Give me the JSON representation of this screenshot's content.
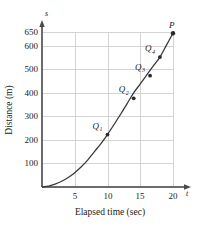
{
  "chart_data": {
    "type": "line",
    "title": "",
    "xlabel": "Elapsed time (sec)",
    "ylabel": "Distance (m)",
    "x_axis_symbol": "t",
    "y_axis_symbol": "s",
    "xlim": [
      0,
      22
    ],
    "ylim": [
      0,
      690
    ],
    "xticks": [
      5,
      10,
      15,
      20
    ],
    "xtick_labels": [
      "5",
      "10",
      "15",
      "20"
    ],
    "yticks": [
      100,
      200,
      300,
      400,
      500,
      600,
      650
    ],
    "ytick_labels": [
      "100",
      "200",
      "300",
      "400",
      "500",
      "600",
      "650"
    ],
    "grid": true,
    "legend": "none",
    "curve_description": "Increasing concave-up distance-time curve from origin to P",
    "series": [
      {
        "name": "distance",
        "x": [
          0,
          1,
          2,
          3,
          4,
          5,
          6,
          7,
          8,
          9,
          10,
          11,
          12,
          13,
          14,
          15,
          16,
          17,
          18,
          19,
          20
        ],
        "values": [
          0,
          4,
          12,
          24,
          40,
          60,
          85,
          114,
          148,
          182,
          220,
          262,
          305,
          350,
          395,
          432,
          470,
          508,
          545,
          595,
          645
        ]
      }
    ],
    "annotations": [
      {
        "label": "Q",
        "subscript": "1",
        "x": 10,
        "y": 220
      },
      {
        "label": "Q",
        "subscript": "2",
        "x": 14,
        "y": 372
      },
      {
        "label": "Q",
        "subscript": "3",
        "x": 16.5,
        "y": 467
      },
      {
        "label": "Q",
        "subscript": "4",
        "x": 18,
        "y": 545
      },
      {
        "label": "P",
        "subscript": "",
        "x": 20,
        "y": 645
      }
    ],
    "colors": {
      "curve": "#3a3a3a",
      "grid": "#c9c9c9",
      "axis": "#6b6b6b",
      "point": "#2a2a2a",
      "background": "#ffffff"
    }
  }
}
